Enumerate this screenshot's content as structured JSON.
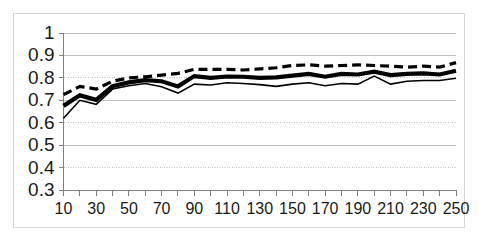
{
  "chart_data": {
    "type": "line",
    "title": "",
    "subtitle": "",
    "xlabel": "",
    "ylabel": "",
    "xlim": [
      10,
      250
    ],
    "ylim": [
      0.3,
      1.0
    ],
    "grid": true,
    "legend_position": "none",
    "x": [
      10,
      20,
      30,
      40,
      50,
      60,
      70,
      80,
      90,
      100,
      110,
      120,
      130,
      140,
      150,
      160,
      170,
      180,
      190,
      200,
      210,
      220,
      230,
      240,
      250
    ],
    "y_ticks": [
      "0.3",
      "0.4",
      "0.5",
      "0.6",
      "0.7",
      "0.8",
      "0.9",
      "1"
    ],
    "y_tick_values": [
      0.3,
      0.4,
      0.5,
      0.6,
      0.7,
      0.8,
      0.9,
      1.0
    ],
    "y_gridline_styles": [
      "solid",
      "dotted",
      "solid",
      "dotted",
      "solid",
      "dotted",
      "solid",
      "solid"
    ],
    "x_tick_values": [
      10,
      20,
      30,
      40,
      50,
      60,
      70,
      80,
      90,
      100,
      110,
      120,
      130,
      140,
      150,
      160,
      170,
      180,
      190,
      200,
      210,
      220,
      230,
      240,
      250
    ],
    "x_labels": [
      "10",
      "30",
      "50",
      "70",
      "90",
      "110",
      "130",
      "150",
      "170",
      "190",
      "210",
      "230",
      "250"
    ],
    "x_label_values": [
      10,
      30,
      50,
      70,
      90,
      110,
      130,
      150,
      170,
      190,
      210,
      230,
      250
    ],
    "series": [
      {
        "name": "upper-dashed",
        "style": "dashed",
        "color": "#000000",
        "width": 3.2,
        "values": [
          0.725,
          0.762,
          0.75,
          0.785,
          0.8,
          0.805,
          0.812,
          0.82,
          0.838,
          0.838,
          0.838,
          0.835,
          0.84,
          0.845,
          0.855,
          0.858,
          0.852,
          0.855,
          0.858,
          0.855,
          0.852,
          0.848,
          0.852,
          0.848,
          0.868
        ]
      },
      {
        "name": "middle-thick-solid",
        "style": "solid",
        "color": "#000000",
        "width": 4.2,
        "values": [
          0.675,
          0.722,
          0.702,
          0.763,
          0.78,
          0.79,
          0.785,
          0.762,
          0.808,
          0.8,
          0.806,
          0.805,
          0.8,
          0.802,
          0.81,
          0.818,
          0.805,
          0.818,
          0.815,
          0.828,
          0.812,
          0.818,
          0.82,
          0.815,
          0.832
        ]
      },
      {
        "name": "lower-thin-solid",
        "style": "solid",
        "color": "#000000",
        "width": 1.6,
        "values": [
          0.62,
          0.7,
          0.682,
          0.75,
          0.765,
          0.775,
          0.76,
          0.732,
          0.772,
          0.768,
          0.778,
          0.775,
          0.77,
          0.762,
          0.772,
          0.778,
          0.765,
          0.775,
          0.772,
          0.808,
          0.772,
          0.785,
          0.788,
          0.788,
          0.798
        ]
      }
    ]
  },
  "axes": {
    "axis_color": "#808080",
    "gridline_color": "#bfbfbf",
    "frame_color": "#d4d4d4",
    "tick_color": "#808080",
    "background": "#ffffff"
  }
}
